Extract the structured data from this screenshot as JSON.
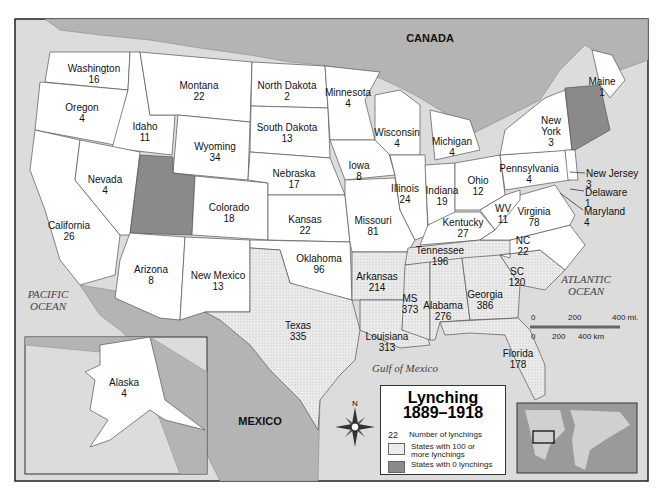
{
  "title": "Lynching",
  "subtitle": "1889–1918",
  "legend": {
    "number_sample": "22",
    "number_label": "Number of lynchings",
    "high_label_1": "States with 100 or",
    "high_label_2": "more lynchings",
    "zero_label": "States with 0 lynchings"
  },
  "colors": {
    "land_foreign": "#b4b4b4",
    "water": "#dcdcdc",
    "state_normal": "#ffffff",
    "state_high": "#e6e6e6",
    "state_zero": "#8a8a8a",
    "border": "#555555"
  },
  "countries": {
    "canada": "CANADA",
    "mexico": "MEXICO"
  },
  "oceans": {
    "pacific_1": "PACIFIC",
    "pacific_2": "OCEAN",
    "atlantic_1": "ATLANTIC",
    "atlantic_2": "OCEAN",
    "gulf": "Gulf of Mexico"
  },
  "compass": {
    "north": "N"
  },
  "scale": {
    "mi_0": "0",
    "mi_200": "200",
    "mi_400": "400 mi.",
    "km_0": "0",
    "km_200": "200",
    "km_400": "400 km"
  },
  "states": [
    {
      "name": "Washington",
      "value": "16"
    },
    {
      "name": "Oregon",
      "value": "4"
    },
    {
      "name": "California",
      "value": "26"
    },
    {
      "name": "Idaho",
      "value": "11"
    },
    {
      "name": "Nevada",
      "value": "4"
    },
    {
      "name": "Montana",
      "value": "22"
    },
    {
      "name": "Wyoming",
      "value": "34"
    },
    {
      "name": "Colorado",
      "value": "18"
    },
    {
      "name": "Arizona",
      "value": "8"
    },
    {
      "name": "New Mexico",
      "value": "13"
    },
    {
      "name": "North Dakota",
      "value": "2"
    },
    {
      "name": "South Dakota",
      "value": "13"
    },
    {
      "name": "Nebraska",
      "value": "17"
    },
    {
      "name": "Kansas",
      "value": "22"
    },
    {
      "name": "Oklahoma",
      "value": "96"
    },
    {
      "name": "Texas",
      "value": "335"
    },
    {
      "name": "Minnesota",
      "value": "4"
    },
    {
      "name": "Iowa",
      "value": "8"
    },
    {
      "name": "Missouri",
      "value": "81"
    },
    {
      "name": "Arkansas",
      "value": "214"
    },
    {
      "name": "Louisiana",
      "value": "313"
    },
    {
      "name": "Wisconsin",
      "value": "4"
    },
    {
      "name": "Illinois",
      "value": "24"
    },
    {
      "name": "Michigan",
      "value": "4"
    },
    {
      "name": "Indiana",
      "value": "19"
    },
    {
      "name": "Ohio",
      "value": "12"
    },
    {
      "name": "Kentucky",
      "value": "27"
    },
    {
      "name": "Tennessee",
      "value": "196"
    },
    {
      "name": "MS",
      "value": "373"
    },
    {
      "name": "Alabama",
      "value": "276"
    },
    {
      "name": "Georgia",
      "value": "386"
    },
    {
      "name": "Florida",
      "value": "178"
    },
    {
      "name": "SC",
      "value": "120"
    },
    {
      "name": "NC",
      "value": "22"
    },
    {
      "name": "Virginia",
      "value": "78"
    },
    {
      "name": "WV",
      "value": "11"
    },
    {
      "name": "Pennsylvania",
      "value": "4"
    },
    {
      "name": "New York",
      "value": "3"
    },
    {
      "name": "Maine",
      "value": "1"
    },
    {
      "name": "New Jersey",
      "value": "3"
    },
    {
      "name": "Delaware",
      "value": "1"
    },
    {
      "name": "Maryland",
      "value": "4"
    },
    {
      "name": "Alaska",
      "value": "4"
    }
  ]
}
